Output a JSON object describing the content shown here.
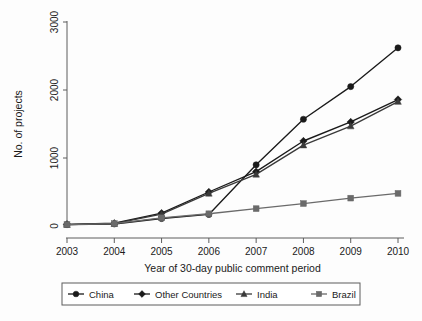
{
  "chart_data": {
    "type": "line",
    "title": "",
    "xlabel": "Year of 30-day public comment period",
    "ylabel": "No. of projects",
    "x": [
      2003,
      2004,
      2005,
      2006,
      2007,
      2008,
      2009,
      2010
    ],
    "xtick_labels": [
      "2003",
      "2004",
      "2005",
      "2006",
      "2007",
      "2008",
      "2009",
      "2010"
    ],
    "ytick_labels": [
      "0",
      "1000",
      "2000",
      "3000"
    ],
    "yticks": [
      0,
      1000,
      2000,
      3000
    ],
    "ylim": [
      0,
      3100
    ],
    "xlim": [
      2003,
      2010
    ],
    "grid": false,
    "legend_position": "bottom",
    "series": [
      {
        "name": "China",
        "marker": "circle",
        "color": "#1a1a1a",
        "values": [
          20,
          30,
          110,
          170,
          900,
          1570,
          2050,
          2620
        ]
      },
      {
        "name": "Other Countries",
        "marker": "diamond",
        "color": "#1a1a1a",
        "values": [
          25,
          40,
          190,
          500,
          800,
          1250,
          1530,
          1860
        ]
      },
      {
        "name": "India",
        "marker": "triangle",
        "color": "#3a3a3a",
        "values": [
          20,
          35,
          175,
          480,
          760,
          1190,
          1470,
          1830
        ]
      },
      {
        "name": "Brazil",
        "marker": "square",
        "color": "#6a6a6a",
        "values": [
          20,
          35,
          120,
          180,
          255,
          330,
          410,
          480
        ]
      }
    ]
  }
}
